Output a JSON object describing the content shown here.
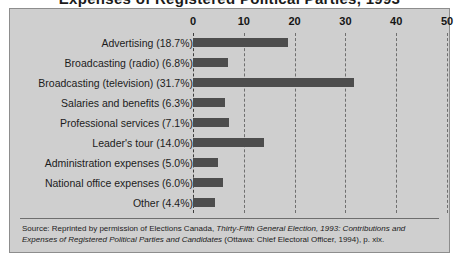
{
  "title_cut": "Expenses of Registered Political Parties, 1993",
  "chart_data": {
    "type": "bar",
    "orientation": "horizontal",
    "title": "",
    "xlabel": "",
    "ylabel": "",
    "xlim": [
      0,
      50
    ],
    "xticks": [
      0,
      10,
      20,
      30,
      40,
      50
    ],
    "grid": true,
    "legend": "none",
    "bar_color": "#4d4d4d",
    "background": "#cfcfcf",
    "categories": [
      "Advertising (18.7%)",
      "Broadcasting (radio) (6.8%)",
      "Broadcasting (television) (31.7%)",
      "Salaries and benefits (6.3%)",
      "Professional services (7.1%)",
      "Leader's tour (14.0%)",
      "Administration expenses (5.0%)",
      "National office expenses (6.0%)",
      "Other (4.4%)"
    ],
    "values": [
      18.7,
      6.8,
      31.7,
      6.3,
      7.1,
      14.0,
      5.0,
      6.0,
      4.4
    ]
  },
  "source": {
    "line1_plain_a": "Source: Reprinted by permission of Elections Canada, ",
    "line1_italic": "Thirty-Fifth General Election, 1993: Contributions and Expenses of Registered Political Parties and Candidates",
    "line2_plain_b": " (Ottawa: Chief Electoral Officer, 1994), p. xix."
  }
}
